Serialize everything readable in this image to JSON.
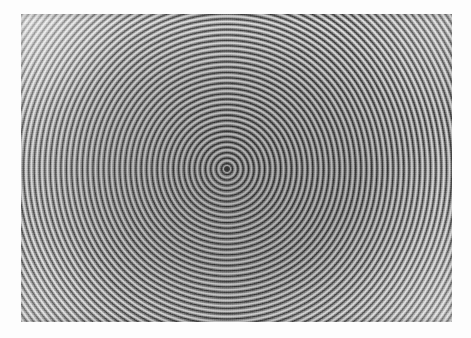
{
  "media": {
    "type": "photograph",
    "subject": "concentric-circles-target-pattern",
    "palette": "black-and-white",
    "surround_color": "#fdfdfd",
    "print_bounds": {
      "left": 21,
      "top": 14,
      "width": 431,
      "height": 308
    }
  },
  "pattern": {
    "name": "concentric-rings",
    "center_x": 227,
    "center_y": 169,
    "ring_period_px": 5.35,
    "visible_ring_count": 44,
    "dark_band_color": "#3b3b3b",
    "light_band_color": "#e2e2e2",
    "mid_tone_color": "#8c8c8c",
    "center_dot_color": "#2e2e2e",
    "lighting_direction": "upper-left",
    "corner_highlight": true
  },
  "chart_data": {
    "type": "line",
    "title": "",
    "xlabel": "",
    "ylabel": "",
    "categories": [],
    "values": []
  },
  "labels": {
    "photo_alt": "Black and white photograph of a disc incised with many evenly spaced concentric circles",
    "center_marker": "bullseye center dot"
  }
}
